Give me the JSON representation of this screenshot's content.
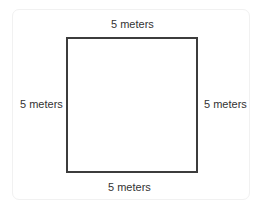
{
  "diagram": {
    "shape": "square",
    "labels": {
      "top": "5 meters",
      "bottom": "5 meters",
      "left": "5 meters",
      "right": "5 meters"
    },
    "colors": {
      "outline": "#3c3c3c",
      "text": "#333333",
      "card_border": "#f1f1f1"
    }
  }
}
